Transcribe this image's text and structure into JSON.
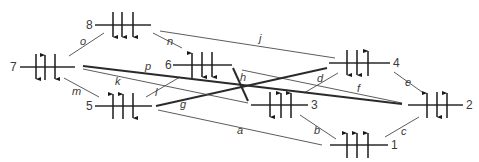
{
  "diagram": {
    "type": "spin-state network",
    "nodes": [
      {
        "id": "1",
        "label": "1",
        "x1": 330,
        "x2": 388,
        "y": 145,
        "label_x": 391,
        "label_side": "right",
        "spins": [
          "up",
          "up",
          "up"
        ],
        "spin_x": [
          347,
          357,
          368
        ]
      },
      {
        "id": "2",
        "label": "2",
        "x1": 408,
        "x2": 463,
        "y": 105,
        "label_x": 466,
        "label_side": "right",
        "spins": [
          "up",
          "down",
          "up"
        ],
        "spin_x": [
          427,
          437,
          447
        ]
      },
      {
        "id": "3",
        "label": "3",
        "x1": 251,
        "x2": 308,
        "y": 105,
        "label_x": 311,
        "label_side": "right",
        "spins": [
          "down",
          "up",
          "up"
        ],
        "spin_x": [
          270,
          281,
          291
        ]
      },
      {
        "id": "4",
        "label": "4",
        "x1": 329,
        "x2": 390,
        "y": 63,
        "label_x": 393,
        "label_side": "right",
        "spins": [
          "down",
          "down",
          "up"
        ],
        "spin_x": [
          347,
          357,
          368
        ]
      },
      {
        "id": "5",
        "label": "5",
        "x1": 95,
        "x2": 152,
        "y": 106,
        "label_x": 86,
        "label_side": "left",
        "spins": [
          "up",
          "up",
          "down"
        ],
        "spin_x": [
          113,
          123,
          133
        ]
      },
      {
        "id": "6",
        "label": "6",
        "x1": 173,
        "x2": 232,
        "y": 65,
        "label_x": 165,
        "label_side": "left",
        "spins": [
          "up",
          "down",
          "down"
        ],
        "spin_x": [
          192,
          202,
          212
        ]
      },
      {
        "id": "7",
        "label": "7",
        "x1": 20,
        "x2": 75,
        "y": 67,
        "label_x": 10,
        "label_side": "left",
        "spins": [
          "down",
          "up",
          "down"
        ],
        "spin_x": [
          36,
          45,
          55
        ]
      },
      {
        "id": "8",
        "label": "8",
        "x1": 95,
        "x2": 151,
        "y": 25,
        "label_x": 86,
        "label_side": "left",
        "spins": [
          "down",
          "down",
          "down"
        ],
        "spin_x": [
          113,
          122,
          133
        ]
      }
    ],
    "edges": [
      {
        "label": "a",
        "from": "5",
        "to": "1",
        "x1": 158,
        "y1": 110,
        "x2": 322,
        "y2": 145,
        "weight": "thin",
        "lx": 237,
        "ly": 134
      },
      {
        "label": "b",
        "from": "3",
        "to": "1",
        "x1": 300,
        "y1": 115,
        "x2": 336,
        "y2": 139,
        "weight": "thin",
        "lx": 314,
        "ly": 134
      },
      {
        "label": "c",
        "from": "1",
        "to": "2",
        "x1": 385,
        "y1": 137,
        "x2": 419,
        "y2": 117,
        "weight": "thin",
        "lx": 401,
        "ly": 135
      },
      {
        "label": "d",
        "from": "3",
        "to": "4",
        "x1": 304,
        "y1": 93,
        "x2": 338,
        "y2": 73,
        "weight": "thin",
        "lx": 317,
        "ly": 82
      },
      {
        "label": "e",
        "from": "4",
        "to": "2",
        "x1": 394,
        "y1": 72,
        "x2": 422,
        "y2": 92,
        "weight": "thin",
        "lx": 405,
        "ly": 86
      },
      {
        "label": "f",
        "from": "6",
        "to": "2",
        "x1": 242,
        "y1": 70,
        "x2": 402,
        "y2": 103,
        "weight": "thin",
        "lx": 357,
        "ly": 92
      },
      {
        "label": "g",
        "from": "5",
        "to": "4",
        "x1": 156,
        "y1": 106,
        "x2": 327,
        "y2": 68,
        "weight": "thick",
        "lx": 180,
        "ly": 108
      },
      {
        "label": "h",
        "from": "6",
        "to": "3",
        "x1": 233,
        "y1": 68,
        "x2": 248,
        "y2": 101,
        "weight": "thick",
        "lx": 240,
        "ly": 81
      },
      {
        "label": "j",
        "from": "8",
        "to": "4",
        "x1": 160,
        "y1": 31,
        "x2": 335,
        "y2": 58,
        "weight": "thin",
        "lx": 259,
        "ly": 42
      },
      {
        "label": "k",
        "from": "7",
        "to": "3",
        "x1": 83,
        "y1": 69,
        "x2": 248,
        "y2": 103,
        "weight": "thin",
        "lx": 115,
        "ly": 85
      },
      {
        "label": "l",
        "from": "5",
        "to": "6",
        "x1": 146,
        "y1": 97,
        "x2": 180,
        "y2": 77,
        "weight": "thin",
        "lx": 155,
        "ly": 96
      },
      {
        "label": "m",
        "from": "7",
        "to": "5",
        "x1": 64,
        "y1": 78,
        "x2": 99,
        "y2": 97,
        "weight": "thin",
        "lx": 72,
        "ly": 95
      },
      {
        "label": "n",
        "from": "8",
        "to": "6",
        "x1": 153,
        "y1": 33,
        "x2": 182,
        "y2": 48,
        "weight": "thin",
        "lx": 167,
        "ly": 45
      },
      {
        "label": "o",
        "from": "7",
        "to": "8",
        "x1": 69,
        "y1": 56,
        "x2": 104,
        "y2": 33,
        "weight": "thin",
        "lx": 80,
        "ly": 45
      },
      {
        "label": "p",
        "from": "7",
        "to": "2",
        "x1": 83,
        "y1": 66,
        "x2": 402,
        "y2": 104,
        "weight": "thick",
        "lx": 145,
        "ly": 70
      }
    ]
  }
}
